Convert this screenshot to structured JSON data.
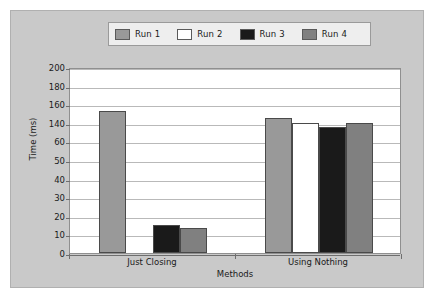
{
  "legend": {
    "position": "top",
    "entries": [
      {
        "label": "Run 1",
        "color": "#999999"
      },
      {
        "label": "Run 2",
        "color": "#ffffff"
      },
      {
        "label": "Run 3",
        "color": "#1a1a1a"
      },
      {
        "label": "Run 4",
        "color": "#808080"
      }
    ]
  },
  "axes": {
    "ylabel": "Time (ms)",
    "xlabel": "Methods"
  },
  "chart_data": {
    "type": "bar",
    "title": "",
    "xlabel": "Methods",
    "ylabel": "Time (ms)",
    "categories": [
      "Just Closing",
      "Using Nothing"
    ],
    "ytick_labels": [
      "200",
      "180",
      "160",
      "140",
      "60",
      "50",
      "40",
      "30",
      "20",
      "10",
      "0"
    ],
    "ytick_note": "axis tick labels are non-uniform as printed: 200,180,160,140,60,50,40,30,20,10,0",
    "grid": true,
    "legend_position": "top",
    "series": [
      {
        "name": "Run 1",
        "color": "#999999",
        "values": [
          173,
          165
        ]
      },
      {
        "name": "Run 2",
        "color": "#ffffff",
        "values": [
          0,
          160
        ]
      },
      {
        "name": "Run 3",
        "color": "#1a1a1a",
        "values": [
          15,
          155
        ]
      },
      {
        "name": "Run 4",
        "color": "#808080",
        "values": [
          13.5,
          160
        ]
      }
    ]
  }
}
